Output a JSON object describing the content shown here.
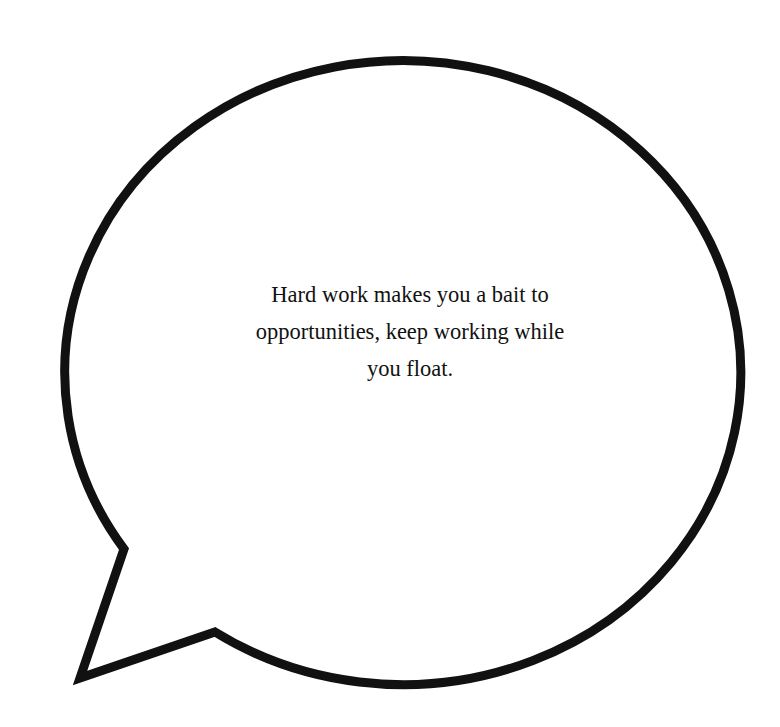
{
  "bubble": {
    "stroke_color": "#111111",
    "fill_color": "#ffffff",
    "background": "#ffffff"
  },
  "quote": {
    "lines": [
      "Hard work makes you a bait to",
      "opportunities, keep working while",
      "you float."
    ],
    "full_text": "Hard work makes you a bait to opportunities, keep working while you float."
  }
}
